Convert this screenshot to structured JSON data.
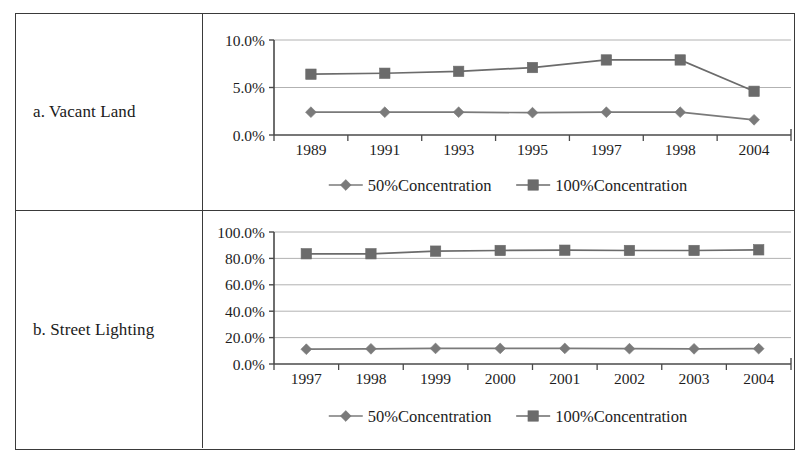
{
  "figure": {
    "rows": [
      {
        "label": "a. Vacant Land",
        "chart_ref": 0
      },
      {
        "label": "b. Street Lighting",
        "chart_ref": 1
      }
    ]
  },
  "legend": {
    "series_50_label": "50%Concentration",
    "series_100_label": "100%Concentration",
    "marker_50": "diamond-marker",
    "marker_100": "square-marker"
  },
  "colors": {
    "series_50": "#7a7a7a",
    "series_100": "#6b6b6b",
    "axis": "#4a4a4a",
    "gridline": "#a9a9a9",
    "border": "#3a3a3a",
    "text": "#1d1d1d"
  },
  "chart_data": [
    {
      "type": "line",
      "title": "a. Vacant Land",
      "xlabel": "",
      "ylabel": "",
      "ylim": [
        0,
        10
      ],
      "ytick_labels": [
        "0.0%",
        "5.0%",
        "10.0%"
      ],
      "ytick_values": [
        0,
        5,
        10
      ],
      "grid": true,
      "legend_position": "bottom",
      "categories": [
        "1989",
        "1991",
        "1993",
        "1995",
        "1997",
        "1998",
        "2004"
      ],
      "series": [
        {
          "name": "50%Concentration",
          "marker": "diamond",
          "values": [
            2.4,
            2.4,
            2.4,
            2.35,
            2.4,
            2.4,
            1.6
          ]
        },
        {
          "name": "100%Concentration",
          "marker": "square",
          "values": [
            6.4,
            6.5,
            6.7,
            7.1,
            7.9,
            7.9,
            4.6
          ]
        }
      ]
    },
    {
      "type": "line",
      "title": "b. Street Lighting",
      "xlabel": "",
      "ylabel": "",
      "ylim": [
        0,
        100
      ],
      "ytick_labels": [
        "0.0%",
        "20.0%",
        "40.0%",
        "60.0%",
        "80.0%",
        "100.0%"
      ],
      "ytick_values": [
        0,
        20,
        40,
        60,
        80,
        100
      ],
      "grid": true,
      "legend_position": "bottom",
      "categories": [
        "1997",
        "1998",
        "1999",
        "2000",
        "2001",
        "2002",
        "2003",
        "2004"
      ],
      "series": [
        {
          "name": "50%Concentration",
          "marker": "diamond",
          "values": [
            11.2,
            11.5,
            11.8,
            11.8,
            11.8,
            11.6,
            11.5,
            11.6
          ]
        },
        {
          "name": "100%Concentration",
          "marker": "square",
          "values": [
            83.5,
            83.5,
            85.5,
            86.0,
            86.2,
            86.0,
            86.0,
            86.5
          ]
        }
      ]
    }
  ]
}
